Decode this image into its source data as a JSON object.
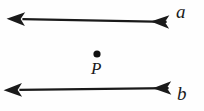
{
  "figure": {
    "background_color": "#fefefe",
    "stroke_color": "#1a1a1a",
    "labels": {
      "line_a": "a",
      "line_b": "b",
      "point_p": "P"
    },
    "point": {
      "name": "P",
      "x": 97,
      "y": 54,
      "radius": 3.6,
      "fill": "#111111"
    },
    "lines": [
      {
        "name": "line-a",
        "label": "a",
        "label_position": "upper-right",
        "double_headed": true,
        "from": {
          "x": 18,
          "y": 19
        },
        "to": {
          "x": 171,
          "y": 22
        },
        "passes_through": "P",
        "stroke_width": 2.2
      },
      {
        "name": "line-b",
        "label": "b",
        "label_position": "lower-right",
        "double_headed": true,
        "from": {
          "x": 15,
          "y": 90
        },
        "to": {
          "x": 173,
          "y": 88
        },
        "passes_through": "P",
        "stroke_width": 2.2
      }
    ],
    "arrowheads": [
      {
        "name": "arrowhead-upper-left",
        "x": 18,
        "y": 19
      },
      {
        "name": "arrowhead-upper-right",
        "x": 171,
        "y": 22
      },
      {
        "name": "arrowhead-lower-left",
        "x": 15,
        "y": 90
      },
      {
        "name": "arrowhead-lower-right",
        "x": 173,
        "y": 88
      }
    ]
  }
}
